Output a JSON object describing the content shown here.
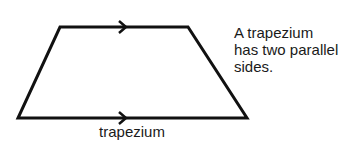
{
  "diagram": {
    "shape_name": "trapezium",
    "label": "trapezium",
    "description_lines": [
      "A trapezium",
      "has two parallel",
      "sides."
    ],
    "stroke_color": "#111111",
    "parallel_markers": [
      "top-edge-arrow",
      "bottom-edge-arrow"
    ]
  }
}
